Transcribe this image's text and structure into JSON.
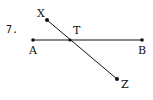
{
  "problem": {
    "number": "7."
  },
  "points": {
    "A": {
      "label": "A",
      "x": 33,
      "y": 40
    },
    "B": {
      "label": "B",
      "x": 142,
      "y": 40
    },
    "T": {
      "label": "T",
      "x": 70,
      "y": 40
    },
    "X": {
      "label": "X",
      "x": 47,
      "y": 20
    },
    "Z": {
      "label": "Z",
      "x": 117,
      "y": 79
    }
  },
  "segments": [
    {
      "from": "A",
      "to": "B"
    },
    {
      "from": "X",
      "to": "Z"
    }
  ],
  "colors": {
    "ink": "#111111",
    "background": "#ffffff"
  }
}
